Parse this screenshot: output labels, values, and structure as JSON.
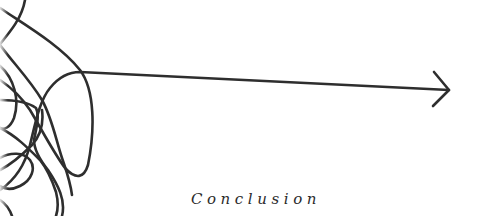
{
  "illustration": {
    "description": "Tangled scribble line resolving into a straight arrow",
    "stroke_color": "#2e2e2e",
    "background_color": "#ffffff",
    "arrow": {
      "from": [
        80,
        72
      ],
      "to": [
        449,
        90
      ]
    }
  },
  "caption": {
    "text": "Conclusion"
  }
}
